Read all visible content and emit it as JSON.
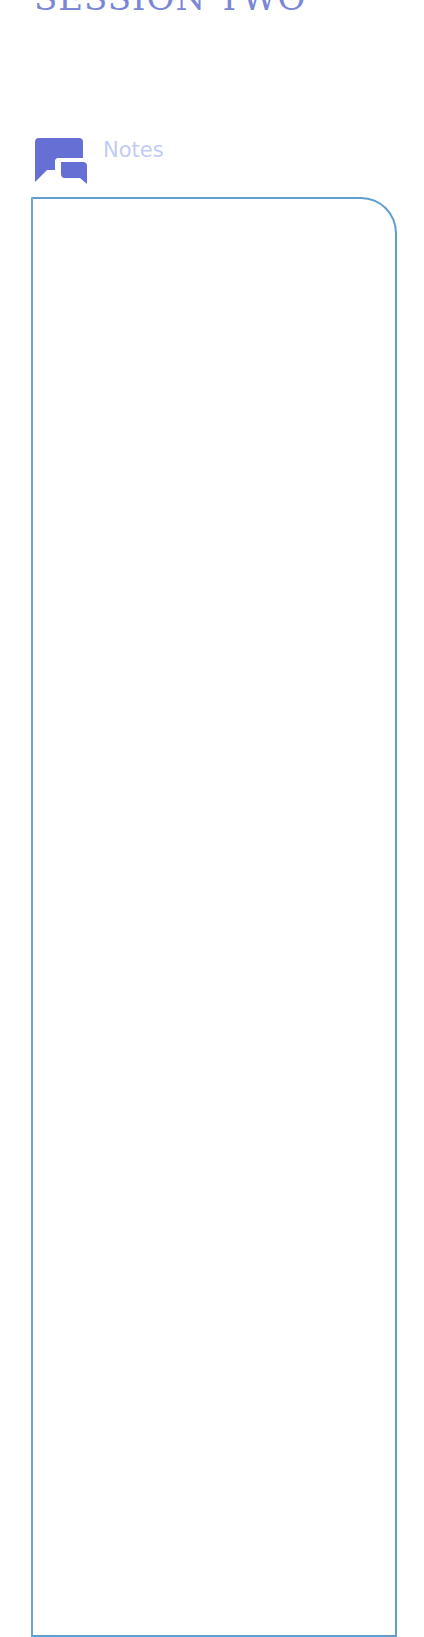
{
  "header": {
    "title": "SESSION TWO"
  },
  "notes": {
    "label": "Notes",
    "icon": "chat-bubbles-icon",
    "content": ""
  },
  "colors": {
    "title": "#7b86d6",
    "icon": "#6670d4",
    "label": "#c2ccf5",
    "border": "#5e9fd0"
  }
}
